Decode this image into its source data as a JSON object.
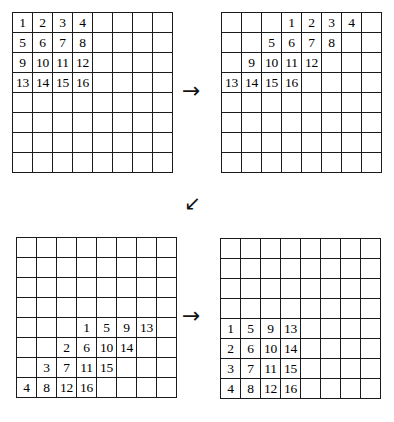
{
  "figure": {
    "grid_size": 8,
    "background_color": "#ffffff",
    "line_color": "#1b1b1b",
    "text_color": "#000000"
  },
  "arrows": [
    {
      "name": "arrow-top",
      "glyph": "→",
      "direction": "right"
    },
    {
      "name": "arrow-middle",
      "glyph": "↙",
      "direction": "down-left"
    },
    {
      "name": "arrow-bottom",
      "glyph": "→",
      "direction": "right"
    }
  ],
  "grids": [
    {
      "id": "grid-1",
      "label": "original-matrix",
      "caption": "Original 4x4 block in top-left corner",
      "cells": [
        [
          "1",
          "2",
          "3",
          "4",
          "",
          "",
          "",
          ""
        ],
        [
          "5",
          "6",
          "7",
          "8",
          "",
          "",
          "",
          ""
        ],
        [
          "9",
          "10",
          "11",
          "12",
          "",
          "",
          "",
          ""
        ],
        [
          "13",
          "14",
          "15",
          "16",
          "",
          "",
          "",
          ""
        ],
        [
          "",
          "",
          "",
          "",
          "",
          "",
          "",
          ""
        ],
        [
          "",
          "",
          "",
          "",
          "",
          "",
          "",
          ""
        ],
        [
          "",
          "",
          "",
          "",
          "",
          "",
          "",
          ""
        ],
        [
          "",
          "",
          "",
          "",
          "",
          "",
          "",
          ""
        ]
      ]
    },
    {
      "id": "grid-2",
      "label": "row-sheared-matrix",
      "caption": "Rows shifted right by decreasing offsets (shear)",
      "cells": [
        [
          "",
          "",
          "",
          "1",
          "2",
          "3",
          "4",
          ""
        ],
        [
          "",
          "",
          "5",
          "6",
          "7",
          "8",
          "",
          ""
        ],
        [
          "",
          "9",
          "10",
          "11",
          "12",
          "",
          "",
          ""
        ],
        [
          "13",
          "14",
          "15",
          "16",
          "",
          "",
          "",
          ""
        ],
        [
          "",
          "",
          "",
          "",
          "",
          "",
          "",
          ""
        ],
        [
          "",
          "",
          "",
          "",
          "",
          "",
          "",
          ""
        ],
        [
          "",
          "",
          "",
          "",
          "",
          "",
          "",
          ""
        ],
        [
          "",
          "",
          "",
          "",
          "",
          "",
          "",
          ""
        ]
      ]
    },
    {
      "id": "grid-3",
      "label": "column-sheared-transposed-matrix",
      "caption": "Columns shifted down, values transposed",
      "cells": [
        [
          "",
          "",
          "",
          "",
          "",
          "",
          "",
          ""
        ],
        [
          "",
          "",
          "",
          "",
          "",
          "",
          "",
          ""
        ],
        [
          "",
          "",
          "",
          "",
          "",
          "",
          "",
          ""
        ],
        [
          "",
          "",
          "",
          "",
          "",
          "",
          "",
          ""
        ],
        [
          "",
          "",
          "",
          "1",
          "5",
          "9",
          "13",
          ""
        ],
        [
          "",
          "",
          "2",
          "6",
          "10",
          "14",
          "",
          ""
        ],
        [
          "",
          "3",
          "7",
          "11",
          "15",
          "",
          "",
          ""
        ],
        [
          "4",
          "8",
          "12",
          "16",
          "",
          "",
          "",
          ""
        ]
      ]
    },
    {
      "id": "grid-4",
      "label": "final-transposed-matrix",
      "caption": "Final transposed 4x4 block in bottom-left corner",
      "cells": [
        [
          "",
          "",
          "",
          "",
          "",
          "",
          "",
          ""
        ],
        [
          "",
          "",
          "",
          "",
          "",
          "",
          "",
          ""
        ],
        [
          "",
          "",
          "",
          "",
          "",
          "",
          "",
          ""
        ],
        [
          "",
          "",
          "",
          "",
          "",
          "",
          "",
          ""
        ],
        [
          "1",
          "5",
          "9",
          "13",
          "",
          "",
          "",
          ""
        ],
        [
          "2",
          "6",
          "10",
          "14",
          "",
          "",
          "",
          ""
        ],
        [
          "3",
          "7",
          "11",
          "15",
          "",
          "",
          "",
          ""
        ],
        [
          "4",
          "8",
          "12",
          "16",
          "",
          "",
          "",
          ""
        ]
      ]
    }
  ]
}
